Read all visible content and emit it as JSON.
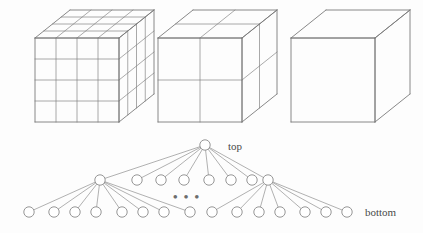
{
  "figure": {
    "background_color": "#fdfdfd",
    "stroke_color": "#7b7b7b",
    "node_stroke_color": "#8a8a8a",
    "edge_color": "#8f8f8f",
    "text_color": "#4a4a4a",
    "cubes": [
      {
        "name": "cube-level-bottom",
        "divisions": 4,
        "origin_x": 35,
        "origin_y": 38,
        "face_size": 84,
        "depth_dx": 35,
        "depth_dy": -28
      },
      {
        "name": "cube-level-middle",
        "divisions": 2,
        "origin_x": 158,
        "origin_y": 38,
        "face_size": 84,
        "depth_dx": 35,
        "depth_dy": -28
      },
      {
        "name": "cube-level-top",
        "divisions": 1,
        "origin_x": 291,
        "origin_y": 38,
        "face_size": 84,
        "depth_dx": 35,
        "depth_dy": -28
      }
    ],
    "tree": {
      "node_radius": 5.2,
      "root": {
        "x": 205,
        "y": 145
      },
      "level2_y": 180,
      "level3_y": 212,
      "branch_nodes": [
        {
          "x": 100,
          "y": 180
        },
        {
          "x": 268,
          "y": 180
        }
      ],
      "level2_plain_nodes": [
        {
          "x": 137,
          "y": 180
        },
        {
          "x": 161,
          "y": 180
        },
        {
          "x": 184,
          "y": 180
        },
        {
          "x": 209,
          "y": 180
        },
        {
          "x": 231,
          "y": 180
        },
        {
          "x": 252,
          "y": 180
        }
      ],
      "leaf_nodes": [
        {
          "x": 29,
          "y": 212
        },
        {
          "x": 54,
          "y": 212
        },
        {
          "x": 75,
          "y": 212
        },
        {
          "x": 96,
          "y": 212
        },
        {
          "x": 122,
          "y": 212
        },
        {
          "x": 143,
          "y": 212
        },
        {
          "x": 164,
          "y": 212
        },
        {
          "x": 190,
          "y": 212
        },
        {
          "x": 212,
          "y": 212
        },
        {
          "x": 237,
          "y": 212
        },
        {
          "x": 259,
          "y": 212
        },
        {
          "x": 280,
          "y": 212
        },
        {
          "x": 305,
          "y": 212
        },
        {
          "x": 326,
          "y": 212
        },
        {
          "x": 347,
          "y": 212
        }
      ],
      "root_child_targets": [
        {
          "x": 100,
          "y": 180
        },
        {
          "x": 137,
          "y": 180
        },
        {
          "x": 161,
          "y": 180
        },
        {
          "x": 184,
          "y": 180
        },
        {
          "x": 209,
          "y": 180
        },
        {
          "x": 231,
          "y": 180
        },
        {
          "x": 252,
          "y": 180
        },
        {
          "x": 268,
          "y": 180
        }
      ],
      "left_branch_child_targets": [
        {
          "x": 29,
          "y": 212
        },
        {
          "x": 54,
          "y": 212
        },
        {
          "x": 75,
          "y": 212
        },
        {
          "x": 96,
          "y": 212
        },
        {
          "x": 122,
          "y": 212
        },
        {
          "x": 143,
          "y": 212
        },
        {
          "x": 164,
          "y": 212
        },
        {
          "x": 190,
          "y": 212
        }
      ],
      "right_branch_child_targets": [
        {
          "x": 212,
          "y": 212
        },
        {
          "x": 237,
          "y": 212
        },
        {
          "x": 259,
          "y": 212
        },
        {
          "x": 280,
          "y": 212
        },
        {
          "x": 305,
          "y": 212
        },
        {
          "x": 326,
          "y": 212
        },
        {
          "x": 347,
          "y": 212
        }
      ]
    },
    "labels": {
      "top": "top",
      "bottom": "bottom",
      "ellipsis": "• • •"
    },
    "label_positions": {
      "top": {
        "x": 228,
        "y": 150
      },
      "bottom": {
        "x": 365,
        "y": 216
      },
      "ellipsis": {
        "x": 173,
        "y": 201
      }
    }
  }
}
